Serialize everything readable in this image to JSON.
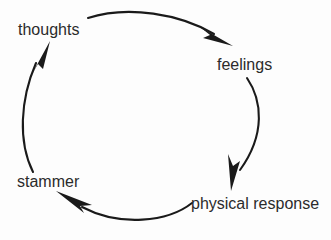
{
  "diagram": {
    "type": "cycle",
    "title": "",
    "background_color": "#fdfdfd",
    "stroke_color": "#1a1a1a",
    "text_color": "#2b2b2b",
    "nodes": [
      {
        "id": "thoughts",
        "label": "thoughts"
      },
      {
        "id": "feelings",
        "label": "feelings"
      },
      {
        "id": "physical-response",
        "label": "physical response"
      },
      {
        "id": "stammer",
        "label": "stammer"
      }
    ],
    "edges": [
      {
        "from": "thoughts",
        "to": "feelings",
        "icon": "curved-arrow-icon"
      },
      {
        "from": "feelings",
        "to": "physical-response",
        "icon": "curved-arrow-icon"
      },
      {
        "from": "physical-response",
        "to": "stammer",
        "icon": "curved-arrow-icon"
      },
      {
        "from": "stammer",
        "to": "thoughts",
        "icon": "curved-arrow-icon"
      }
    ]
  }
}
